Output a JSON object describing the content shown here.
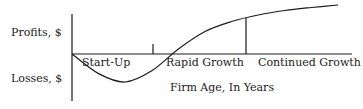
{
  "diagram": {
    "type": "line",
    "title": "",
    "y_labels": {
      "top": "Profits, $",
      "bottom": "Losses, $"
    },
    "xlabel": "Firm Age, In Years",
    "stages": [
      "Start-Up",
      "Rapid Growth",
      "Continued Growth"
    ]
  },
  "chart_data": {
    "type": "line",
    "title": "",
    "xlabel": "Firm Age, In Years",
    "ylabel_positive": "Profits, $",
    "ylabel_negative": "Losses, $",
    "grid": false,
    "series": [
      {
        "name": "Profit curve",
        "x": [
          0,
          0.1,
          0.2,
          0.3,
          0.4,
          0.5,
          0.6,
          0.7,
          0.8,
          0.9,
          1.0
        ],
        "y": [
          0,
          -0.7,
          -1.0,
          -0.6,
          0.1,
          0.45,
          0.65,
          0.78,
          0.87,
          0.93,
          0.98
        ]
      }
    ],
    "stage_boundaries": [
      0.4,
      0.7
    ],
    "stages": [
      "Start-Up",
      "Rapid Growth",
      "Continued Growth"
    ]
  }
}
